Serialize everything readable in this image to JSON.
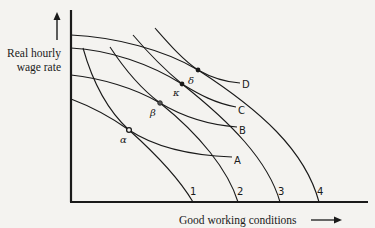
{
  "diagram": {
    "y_axis_label_line1": "Real hourly",
    "y_axis_label_line2": "wage rate",
    "x_axis_label": "Good working conditions",
    "indifference_curves": [
      {
        "id": "A",
        "label": "A"
      },
      {
        "id": "B",
        "label": "B"
      },
      {
        "id": "C",
        "label": "C"
      },
      {
        "id": "D",
        "label": "D"
      }
    ],
    "frontier_curves": [
      {
        "id": "1",
        "label": "1"
      },
      {
        "id": "2",
        "label": "2"
      },
      {
        "id": "3",
        "label": "3"
      },
      {
        "id": "4",
        "label": "4"
      }
    ],
    "tangency_points": [
      {
        "id": "alpha",
        "label": "α",
        "curves": [
          "A",
          "1"
        ]
      },
      {
        "id": "beta",
        "label": "β",
        "curves": [
          "B",
          "2"
        ]
      },
      {
        "id": "kappa",
        "label": "κ",
        "curves": [
          "C",
          "3"
        ]
      },
      {
        "id": "delta",
        "label": "δ",
        "curves": [
          "D",
          "4"
        ]
      }
    ]
  }
}
